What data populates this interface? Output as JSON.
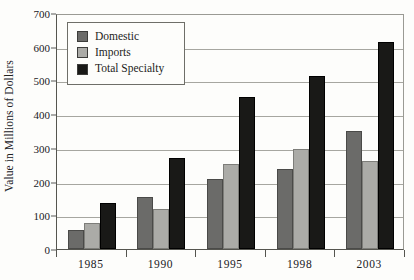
{
  "chart_data": {
    "type": "bar",
    "title": "",
    "xlabel": "",
    "ylabel": "Value in Millions of Dollars",
    "categories": [
      "1985",
      "1990",
      "1995",
      "1998",
      "2003"
    ],
    "series": [
      {
        "name": "Domestic",
        "color": "#6b6b69",
        "values": [
          57,
          155,
          208,
          238,
          350
        ]
      },
      {
        "name": "Imports",
        "color": "#ababa7",
        "values": [
          78,
          118,
          252,
          297,
          262
        ]
      },
      {
        "name": "Total Specialty",
        "color": "#191917",
        "values": [
          137,
          270,
          450,
          512,
          615
        ]
      }
    ],
    "ylim": [
      0,
      700
    ],
    "yticks": [
      0,
      100,
      200,
      300,
      400,
      500,
      600,
      700
    ],
    "ytick_labels": [
      "0",
      "100",
      "200",
      "300",
      "400",
      "500",
      "600",
      "700"
    ],
    "grid": true,
    "legend_position": "upper-left-inside"
  },
  "legend": {
    "items": [
      {
        "label": "Domestic",
        "swatch_color": "#6b6b69"
      },
      {
        "label": "Imports",
        "swatch_color": "#ababa7"
      },
      {
        "label": "Total Specialty",
        "swatch_color": "#191917"
      }
    ]
  }
}
